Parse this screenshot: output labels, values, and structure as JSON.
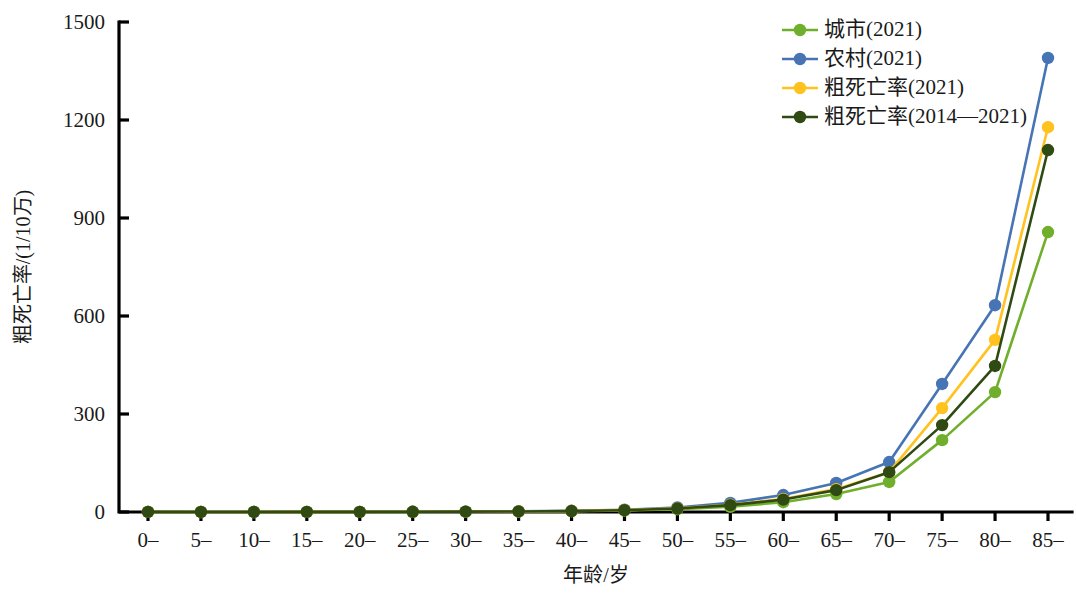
{
  "chart_data": {
    "type": "line",
    "title": "",
    "xlabel": "年龄/岁",
    "ylabel": "粗死亡率/(1/10万)",
    "categories": [
      "0–",
      "5–",
      "10–",
      "15–",
      "20–",
      "25–",
      "30–",
      "35–",
      "40–",
      "45–",
      "50–",
      "55–",
      "60–",
      "65–",
      "70–",
      "75–",
      "80–",
      "85–"
    ],
    "ylim": [
      0,
      1500
    ],
    "yticks": [
      0,
      300,
      600,
      900,
      1200,
      1500
    ],
    "grid": false,
    "legend_position": "top-right",
    "series": [
      {
        "name": "城市(2021)",
        "color": "#6FAF2B",
        "values": [
          0.3,
          0.2,
          0.2,
          0.3,
          0.4,
          0.5,
          0.8,
          1.4,
          2.5,
          4.5,
          8.5,
          16,
          30,
          55,
          92,
          220,
          367,
          857
        ]
      },
      {
        "name": "农村(2021)",
        "color": "#4674B4",
        "values": [
          0.4,
          0.2,
          0.2,
          0.3,
          0.5,
          0.7,
          1.1,
          2.0,
          3.8,
          7.0,
          14,
          28,
          52,
          89,
          153,
          392,
          633,
          1390
        ]
      },
      {
        "name": "粗死亡率(2021)",
        "color": "#FFC21E",
        "values": [
          0.35,
          0.2,
          0.2,
          0.3,
          0.45,
          0.6,
          1.0,
          1.7,
          3.1,
          5.8,
          11,
          22,
          40,
          70,
          122,
          318,
          527,
          1178
        ]
      },
      {
        "name": "粗死亡率(2014—2021)",
        "color": "#2F4A12",
        "values": [
          0.35,
          0.2,
          0.2,
          0.3,
          0.45,
          0.6,
          1.0,
          1.7,
          3.0,
          5.5,
          10.5,
          21,
          38,
          67,
          122,
          266,
          447,
          1108
        ]
      }
    ]
  },
  "legend": {
    "items": [
      {
        "label": "城市(2021)",
        "color": "#6FAF2B"
      },
      {
        "label": "农村(2021)",
        "color": "#4674B4"
      },
      {
        "label": "粗死亡率(2021)",
        "color": "#FFC21E"
      },
      {
        "label": "粗死亡率(2014—2021)",
        "color": "#2F4A12"
      }
    ]
  },
  "axes": {
    "y_title": "粗死亡率/(1/10万)",
    "x_title": "年龄/岁",
    "y_tick_labels": [
      "1500",
      "1200",
      "900",
      "600",
      "300",
      "0"
    ],
    "x_tick_labels": [
      "0–",
      "5–",
      "10–",
      "15–",
      "20–",
      "25–",
      "30–",
      "35–",
      "40–",
      "45–",
      "50–",
      "55–",
      "60–",
      "65–",
      "70–",
      "75–",
      "80–",
      "85–"
    ]
  }
}
